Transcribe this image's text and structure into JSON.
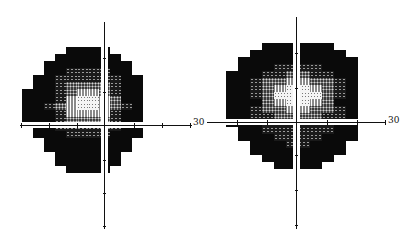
{
  "figure": {
    "type": "visual-field-grayscale-pair",
    "plots": [
      {
        "id": "left-eye",
        "axis_label": "30",
        "axis_label_pos": [
          193,
          118
        ],
        "origin": [
          104,
          125
        ],
        "vaxis": {
          "x": 104,
          "y1": 22,
          "y2": 229
        },
        "haxis": {
          "y": 125,
          "x1": 20,
          "x2": 192
        },
        "vticks": [
          58,
          92,
          160,
          193,
          226
        ],
        "hticks": [
          21,
          49,
          77,
          134,
          162,
          190
        ],
        "cell_w": 11,
        "cell_h": 7,
        "grid_left": 22,
        "grid_top": 47,
        "rows": [
          "....00|00....",
          "...000|000...",
          "..0000|0000..",
          "..0011|1100..",
          ".00111|11100.",
          ".00122|22100.",
          "000123|32100.",
          "000134|43200.",
          "001234|43210.",
          "000133|33100.",
          "000122|22100.",
          ".00111|11100.",
          ".00011|11000.",
          "..0000|0000..",
          "..0000|0000..",
          "...000|000...",
          "...000|000...",
          "....00|00...."
        ]
      },
      {
        "id": "right-eye",
        "axis_label": "30",
        "axis_label_pos": [
          388,
          116
        ],
        "origin": [
          296,
          122
        ],
        "vaxis": {
          "x": 296,
          "y1": 17,
          "y2": 229
        },
        "haxis": {
          "y": 122,
          "x1": 207,
          "x2": 386
        },
        "vticks": [
          53,
          88,
          155,
          190,
          225
        ],
        "hticks": [
          237,
          267,
          327,
          357,
          385
        ],
        "cell_w": 12,
        "cell_h": 7,
        "grid_left": 226,
        "grid_top": 43,
        "rows": [
          "...000|000...",
          "..0000|0000..",
          ".00000|00000.",
          ".00011|11000.",
          "000112|21100.",
          "001223|32210.",
          "001234|43210.",
          "001244|44210.",
          "000234|43200.",
          "001223|32210.",
          "001122|22110.",
          "000111|11100.",
          ".00111|11100.",
          ".00011|11000.",
          "..0001|1000..",
          "..0000|0000..",
          "...000|000...",
          "....00|00...."
        ]
      }
    ]
  }
}
